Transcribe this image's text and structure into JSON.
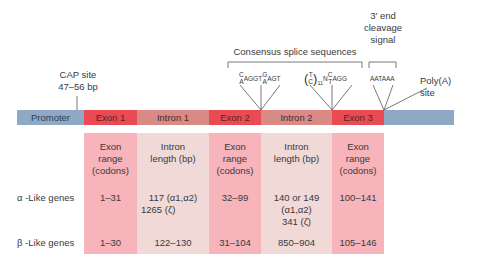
{
  "annotations": {
    "cap_site": {
      "line1": "CAP site",
      "line2": "47–56 bp"
    },
    "splice_title": "Consensus splice sequences",
    "cleavage": {
      "line1": "3' end",
      "line2": "cleavage",
      "line3": "signal"
    },
    "polya": {
      "line1": "Poly(A)",
      "line2": "site"
    },
    "seq_donor": {
      "top1": "C",
      "bot1": "A",
      "mid": "AGGT",
      "top2": "G",
      "bot2": "A",
      "end": "AGT"
    },
    "seq_acceptor": {
      "paren_top": "T",
      "paren_bot": "C",
      "sub": "11",
      "n": "N",
      "top": "C",
      "bot": "T",
      "end": "AGG"
    },
    "seq_polya": "AATAAA"
  },
  "gene_bar": {
    "segments": [
      {
        "label": "Promoter",
        "color": "#8fa8c4"
      },
      {
        "label": "Exon 1",
        "color": "#ea4a52"
      },
      {
        "label": "Intron 1",
        "color": "#d98a84"
      },
      {
        "label": "Exon 2",
        "color": "#ea4a52"
      },
      {
        "label": "Intron 2",
        "color": "#d98a84"
      },
      {
        "label": "Exon 3",
        "color": "#ea4a52"
      },
      {
        "label": "",
        "color": "#8fa8c4"
      }
    ]
  },
  "table": {
    "headers": [
      {
        "l1": "Exon",
        "l2": "range",
        "l3": "(codons)"
      },
      {
        "l1": "Intron",
        "l2": "length (bp)",
        "l3": ""
      },
      {
        "l1": "Exon",
        "l2": "range",
        "l3": "(codons)"
      },
      {
        "l1": "Intron",
        "l2": "length (bp)",
        "l3": ""
      },
      {
        "l1": "Exon",
        "l2": "range",
        "l3": "(codons)"
      }
    ],
    "rows": [
      {
        "label": "α -Like genes",
        "cells": [
          "1–31",
          "117 (α1,α2)",
          "32–99",
          "140 or 149",
          "100–141"
        ],
        "extra": {
          "intron1_line2": "1265 (ζ)",
          "intron2_line2": "(α1,α2)",
          "intron2_line3": "341 (ζ)"
        }
      },
      {
        "label": "β -Like genes",
        "cells": [
          "1–30",
          "122–130",
          "31–104",
          "850–904",
          "105–146"
        ]
      }
    ]
  }
}
